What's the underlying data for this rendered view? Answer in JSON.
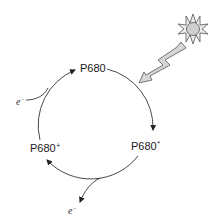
{
  "diagram": {
    "nodes": [
      {
        "id": "p680",
        "label": "P680",
        "superscript": ""
      },
      {
        "id": "p680_excited",
        "label": "P680",
        "superscript": "*"
      },
      {
        "id": "p680_oxidized",
        "label": "P680",
        "superscript": "+"
      }
    ],
    "electrons": [
      {
        "id": "electron_in",
        "symbol": "e",
        "superscript": "−"
      },
      {
        "id": "electron_out",
        "symbol": "e",
        "superscript": "−"
      }
    ],
    "edges": [
      {
        "from": "p680",
        "to": "p680_excited",
        "via": "light"
      },
      {
        "from": "p680_excited",
        "to": "p680_oxidized",
        "releases": "electron_out"
      },
      {
        "from": "p680_oxidized",
        "to": "p680",
        "accepts": "electron_in"
      }
    ],
    "icons": {
      "sun": "sun-icon",
      "lightning": "lightning-bolt-icon"
    },
    "colors": {
      "line": "#333333",
      "sun_fill": "#d0d0d0",
      "bolt_fill": "#d6d6d6",
      "stroke": "#555555"
    }
  }
}
